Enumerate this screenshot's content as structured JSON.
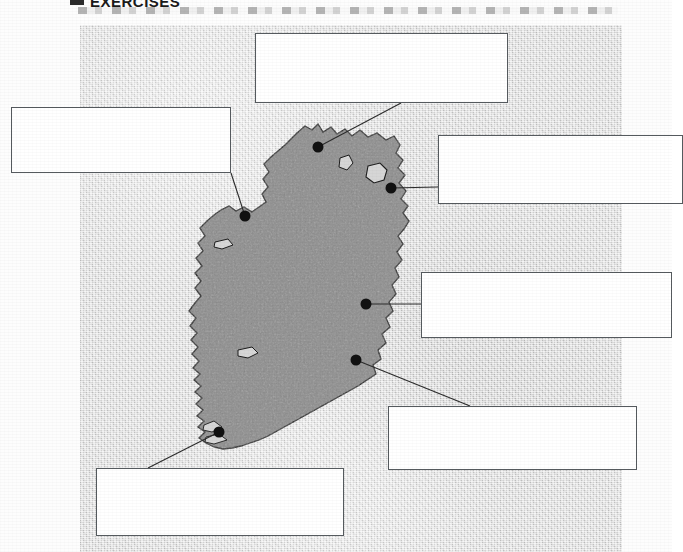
{
  "header": {
    "bullet_icon": "square-bullet-icon",
    "title": "EXERCISES",
    "smudge": "scan-artifact-band"
  },
  "map": {
    "region_name": "Ireland",
    "caption": "",
    "background_texture": "mottled-grey-paper",
    "land_color": "#8e8e8e",
    "sea_color": "#d6d6d6",
    "outline_color": "#1d1d1d",
    "marker_color": "#111111",
    "leader_line_color": "#2b2b2b"
  },
  "markers": [
    {
      "id": "marker-north",
      "name": "map-marker-north",
      "x": 318,
      "y": 147,
      "label_box": "box-north"
    },
    {
      "id": "marker-west",
      "name": "map-marker-west",
      "x": 245,
      "y": 216,
      "label_box": "box-west"
    },
    {
      "id": "marker-northeast",
      "name": "map-marker-northeast",
      "x": 391,
      "y": 188,
      "label_box": "box-northeast"
    },
    {
      "id": "marker-east",
      "name": "map-marker-east",
      "x": 366,
      "y": 304,
      "label_box": "box-east"
    },
    {
      "id": "marker-southeast",
      "name": "map-marker-southeast",
      "x": 356,
      "y": 360,
      "label_box": "box-southeast"
    },
    {
      "id": "marker-south",
      "name": "map-marker-south",
      "x": 219,
      "y": 432,
      "label_box": "box-south"
    }
  ],
  "label_boxes": [
    {
      "id": "box-north",
      "value": "",
      "placeholder": ""
    },
    {
      "id": "box-west",
      "value": "",
      "placeholder": ""
    },
    {
      "id": "box-northeast",
      "value": "",
      "placeholder": ""
    },
    {
      "id": "box-east",
      "value": "",
      "placeholder": ""
    },
    {
      "id": "box-southeast",
      "value": "",
      "placeholder": ""
    },
    {
      "id": "box-south",
      "value": "",
      "placeholder": ""
    }
  ]
}
